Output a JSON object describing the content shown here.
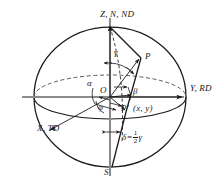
{
  "figure": {
    "colors": {
      "outline": "#1a1a1a",
      "axis": "#8c8c8c",
      "dashed": "#5a5a5a",
      "text": "#1a1a1a",
      "background": "#ffffff"
    },
    "geometry": {
      "center_x": 110,
      "center_y": 97,
      "radius_x": 76,
      "radius_y": 70,
      "equator_ry": 22
    }
  },
  "axis_labels": [
    {
      "name": "z-axis-label",
      "text": "Z, N, ND",
      "x": 100,
      "y": 12
    },
    {
      "name": "y-axis-label",
      "text": "Y, RD",
      "x": 190,
      "y": 88
    },
    {
      "name": "x-axis-label",
      "text": "X, TD",
      "x": 38,
      "y": 128
    },
    {
      "name": "south-pole-label",
      "text": "S",
      "x": 104,
      "y": 171
    }
  ],
  "point_labels": [
    {
      "name": "point-p-label",
      "text": "P",
      "x": 145,
      "y": 56
    },
    {
      "name": "point-o-label",
      "text": "O",
      "x": 100,
      "y": 90
    },
    {
      "name": "point-p-prime-label",
      "text": "P'",
      "x": 121,
      "y": 108
    },
    {
      "name": "point-p-prime-coords",
      "text": "(x, y)",
      "x": 133,
      "y": 108
    }
  ],
  "angle_labels": [
    {
      "name": "angle-gamma-label",
      "text": "γ",
      "x": 114,
      "y": 53
    },
    {
      "name": "angle-alpha-label",
      "text": "α",
      "x": 88,
      "y": 84
    },
    {
      "name": "angle-beta-label",
      "text": "β",
      "x": 133,
      "y": 91
    },
    {
      "name": "angle-phi-label",
      "text": "φ",
      "x": 98,
      "y": 107
    }
  ],
  "equation": {
    "name": "delta-equation",
    "delta": "δ",
    "equals": "=",
    "numerator": "1",
    "denominator": "2",
    "gamma": "γ",
    "x": 122,
    "y": 134
  }
}
